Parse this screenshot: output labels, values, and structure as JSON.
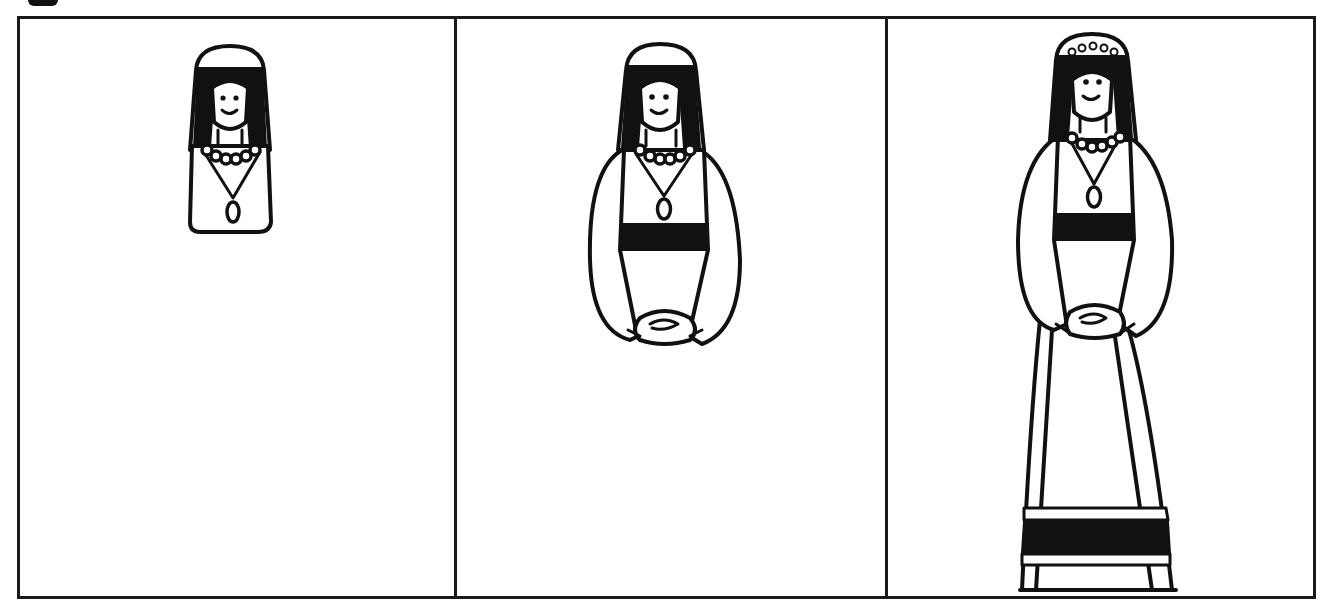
{
  "figure": {
    "type": "step-by-step drawing sequence",
    "panel_count": 3,
    "colors": {
      "ink": "#111111",
      "paper": "#ffffff"
    },
    "panels": [
      {
        "index": 1,
        "stage": "head and bust",
        "elements": [
          "veil",
          "hair",
          "face",
          "necklace",
          "pendant",
          "torso-outline"
        ]
      },
      {
        "index": 2,
        "stage": "add sleeves and belt",
        "elements": [
          "veil",
          "hair",
          "face",
          "necklace",
          "pendant",
          "belt",
          "sleeves",
          "folded-hands"
        ]
      },
      {
        "index": 3,
        "stage": "full figure with skirt",
        "elements": [
          "veil",
          "flower-crown",
          "hair",
          "face",
          "necklace",
          "pendant",
          "belt",
          "sleeves",
          "folded-hands",
          "skirt",
          "skirt-stripes",
          "hem-band"
        ]
      }
    ]
  }
}
